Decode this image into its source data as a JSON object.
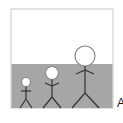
{
  "diagram": {
    "box": {
      "x": 11,
      "y": 9,
      "width": 102,
      "height": 99,
      "border_color": "#c8c8c8",
      "sky_color": "#ffffff",
      "water_color": "#a6a6a6",
      "water_top": 64
    },
    "figures": [
      {
        "name": "small",
        "cx": 26,
        "head_cy": 82,
        "r": 4.5
      },
      {
        "name": "medium",
        "cx": 52,
        "head_cy": 73,
        "r": 6.5
      },
      {
        "name": "large",
        "cx": 85,
        "head_cy": 56,
        "r": 10
      }
    ],
    "edge_text": "A"
  }
}
